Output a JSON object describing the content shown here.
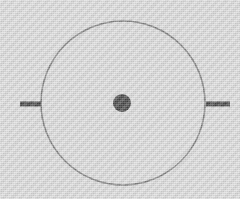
{
  "figure": {
    "type": "schematic-diagram",
    "canvas": {
      "width": 240,
      "height": 199,
      "background_color": "#d4d4d4",
      "texture": "dithered-halftone-grain"
    },
    "elements": {
      "outer_circle": {
        "label": "outer-circle",
        "center_x": 123,
        "center_y": 103,
        "radius": 82,
        "stroke_color": "#595959",
        "stroke_width": 1.6,
        "fill": "none"
      },
      "center_dot": {
        "label": "center-dot",
        "center_x": 122,
        "center_y": 103,
        "radius": 9,
        "fill_color": "#0d0d0d",
        "stroke": "none"
      },
      "left_tick": {
        "label": "left-tick-mark",
        "x1": 20,
        "y1": 104,
        "x2": 41,
        "y2": 104,
        "length": 21,
        "thickness": 5,
        "color": "#0d0d0d"
      },
      "right_tick": {
        "label": "right-tick-mark",
        "x1": 206,
        "y1": 104,
        "x2": 230,
        "y2": 104,
        "length": 24,
        "thickness": 5,
        "color": "#0d0d0d"
      }
    }
  },
  "chart_data": {
    "type": "scatter",
    "subtitle": "",
    "xlabel": "",
    "ylabel": "",
    "xlim": [
      0,
      240
    ],
    "ylim": [
      0,
      199
    ],
    "grid": false,
    "legend": null,
    "annotations": [],
    "tick_labels": {
      "x": [],
      "y": []
    },
    "series": [
      {
        "name": "outer-circle",
        "shape": "circle-outline",
        "cx": 123,
        "cy": 103,
        "r": 82,
        "color": "#595959",
        "linewidth": 1.6
      },
      {
        "name": "center-dot",
        "shape": "circle-filled",
        "cx": 122,
        "cy": 103,
        "r": 9,
        "color": "#0d0d0d"
      },
      {
        "name": "left-tick-mark",
        "shape": "horizontal-segment",
        "x": [
          20,
          41
        ],
        "y": [
          104,
          104
        ],
        "color": "#0d0d0d",
        "linewidth": 5
      },
      {
        "name": "right-tick-mark",
        "shape": "horizontal-segment",
        "x": [
          206,
          230
        ],
        "y": [
          104,
          104
        ],
        "color": "#0d0d0d",
        "linewidth": 5
      }
    ]
  }
}
